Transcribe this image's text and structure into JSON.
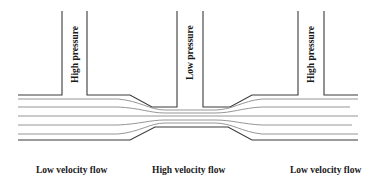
{
  "diagram": {
    "tubes": [
      {
        "id": "left",
        "label": "High pressure",
        "x_left": 62,
        "x_right": 87,
        "bottom": 95
      },
      {
        "id": "middle",
        "label": "Low pressure",
        "x_left": 177,
        "x_right": 203,
        "bottom": 107
      },
      {
        "id": "right",
        "label": "High pressure",
        "x_left": 298,
        "x_right": 324,
        "bottom": 95
      }
    ],
    "regions": [
      {
        "id": "inlet",
        "label": "Low velocity flow"
      },
      {
        "id": "throat",
        "label": "High velocity flow"
      },
      {
        "id": "outlet",
        "label": "Low velocity flow"
      }
    ],
    "colors": {
      "wall": "#3a3a3a",
      "streamline": "#8a8a8a",
      "text": "#1a1a1a",
      "background": "#ffffff"
    },
    "streamline_count": 5
  }
}
